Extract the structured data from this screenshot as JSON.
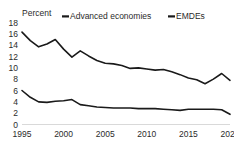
{
  "chart_data": {
    "type": "line",
    "title": "",
    "subtitle": "",
    "unit_label": "Percent",
    "xlabel": "",
    "ylabel": "Percent",
    "ylim": [
      0,
      18
    ],
    "xlim": [
      1995,
      2020
    ],
    "y_ticks": [
      "0",
      "2",
      "4",
      "6",
      "8",
      "10",
      "12",
      "14",
      "16",
      "18"
    ],
    "y_tick_values": [
      0,
      2,
      4,
      6,
      8,
      10,
      12,
      14,
      16,
      18
    ],
    "x_ticks": [
      "1995",
      "2000",
      "2005",
      "2010",
      "2015",
      "2020"
    ],
    "x_tick_values": [
      1995,
      2000,
      2005,
      2010,
      2015,
      2020
    ],
    "x": [
      1995,
      1996,
      1997,
      1998,
      1999,
      2000,
      2001,
      2002,
      2003,
      2004,
      2005,
      2006,
      2007,
      2008,
      2009,
      2010,
      2011,
      2012,
      2013,
      2014,
      2015,
      2016,
      2017,
      2018,
      2019,
      2020
    ],
    "grid": false,
    "legend_position": "top",
    "axis_line_color": "#d9d9d9",
    "series": [
      {
        "name": "Advanced economies",
        "color": "#1a1a1a",
        "line_width": 1.6,
        "marker": "dash",
        "values": [
          6.0,
          4.8,
          4.0,
          3.9,
          4.1,
          4.2,
          4.4,
          3.5,
          3.3,
          3.1,
          3.0,
          2.9,
          2.9,
          2.9,
          2.8,
          2.8,
          2.8,
          2.7,
          2.6,
          2.5,
          2.7,
          2.7,
          2.7,
          2.7,
          2.6,
          1.8
        ]
      },
      {
        "name": "EMDEs",
        "color": "#1a1a1a",
        "line_width": 1.6,
        "marker": "dash",
        "values": [
          16.3,
          14.8,
          13.7,
          14.2,
          15.0,
          13.3,
          11.9,
          13.0,
          12.1,
          11.3,
          10.8,
          10.7,
          10.4,
          9.9,
          10.0,
          9.8,
          9.6,
          9.7,
          9.3,
          8.8,
          8.2,
          7.9,
          7.2,
          8.0,
          9.0,
          7.8
        ]
      }
    ]
  },
  "legend": [
    {
      "label": "Advanced economies",
      "color": "#1a1a1a"
    },
    {
      "label": "EMDEs",
      "color": "#1a1a1a"
    }
  ]
}
